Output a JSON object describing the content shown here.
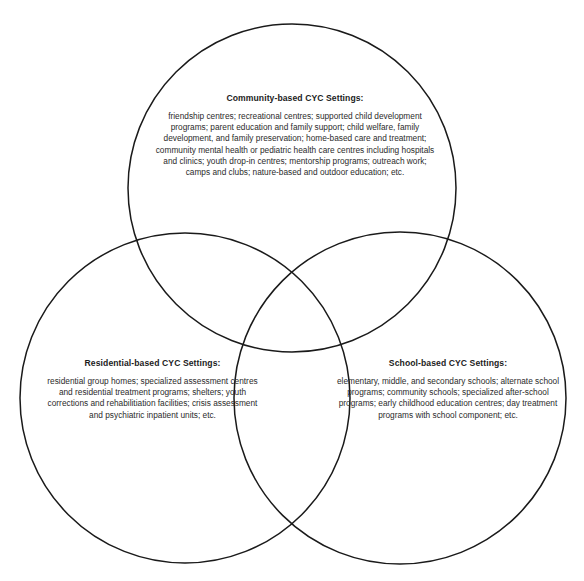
{
  "diagram": {
    "type": "venn-3-circle",
    "background_color": "#ffffff",
    "stroke_color": "#1a1a1a",
    "text_color": "#262626",
    "circles": [
      {
        "id": "community",
        "cx": 292,
        "cy": 188,
        "r": 164
      },
      {
        "id": "residential",
        "cx": 185,
        "cy": 398,
        "r": 165
      },
      {
        "id": "school",
        "cx": 400,
        "cy": 398,
        "r": 166
      }
    ]
  },
  "community": {
    "heading": "Community-based CYC Settings:",
    "body": "friendship centres; recreational centres; supported child development programs; parent education and family support; child welfare, family development, and family preservation; home-based care and treatment; community mental health or pediatric health care centres including hospitals and clinics; youth drop-in centres; mentorship programs; outreach work; camps and clubs; nature-based and outdoor education; etc."
  },
  "residential": {
    "heading": "Residential-based CYC Settings:",
    "body": "residential group homes; specialized assessment centres and residential treatment programs; shelters; youth corrections and rehabilitiation facilities; crisis assessment and psychiatric inpatient units; etc."
  },
  "school": {
    "heading": "School-based CYC Settings:",
    "body": "elementary, middle, and secondary schools; alternate school programs; community schools; specialized after-school programs; early childhood education centres; day treatment programs with school component; etc."
  }
}
